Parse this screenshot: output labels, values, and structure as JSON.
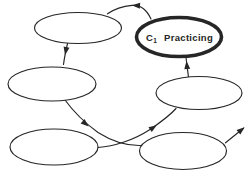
{
  "figure": {
    "width": 252,
    "height": 174,
    "background_color": "#ffffff",
    "ink_color": "#262626"
  },
  "diagram": {
    "type": "cycle-flow",
    "highlighted_node_label": {
      "base": "C",
      "subscript": "1",
      "text": "Practicing"
    },
    "nodes": [
      {
        "id": "stage-top-left",
        "label": "",
        "cx": 78,
        "cy": 28,
        "rx": 43.5,
        "ry": 15.5,
        "emphasis": false
      },
      {
        "id": "stage-c1-practicing",
        "label": "C1 Practicing",
        "cx": 179,
        "cy": 37,
        "rx": 42.5,
        "ry": 19.5,
        "emphasis": true
      },
      {
        "id": "stage-mid-left",
        "label": "",
        "cx": 52,
        "cy": 84,
        "rx": 44,
        "ry": 17,
        "emphasis": false
      },
      {
        "id": "stage-mid-right",
        "label": "",
        "cx": 199,
        "cy": 93,
        "rx": 43,
        "ry": 16.5,
        "emphasis": false
      },
      {
        "id": "stage-bottom-left",
        "label": "",
        "cx": 54,
        "cy": 147,
        "rx": 44,
        "ry": 18,
        "emphasis": false
      },
      {
        "id": "stage-bottom-right",
        "label": "",
        "cx": 183,
        "cy": 151,
        "rx": 43.5,
        "ry": 18.5,
        "emphasis": false
      }
    ],
    "edges": [
      {
        "id": "edge-c1-to-top-left",
        "from": "stage-c1-practicing",
        "to": "stage-top-left",
        "path": "M 151,19 C 146,8 140,4.8 132,5.4 C 121,6.4 113,10 107.5,13.8",
        "head": {
          "x": 133.5,
          "y": 5.3,
          "angle": 184
        }
      },
      {
        "id": "edge-top-left-to-mid-left",
        "from": "stage-top-left",
        "to": "stage-mid-left",
        "path": "M 67.5,43.5 C 66,50 64.5,57 63.5,64.5",
        "head": {
          "x": 65.3,
          "y": 53.5,
          "angle": 101
        }
      },
      {
        "id": "edge-mid-left-to-bottom-right",
        "from": "stage-mid-left",
        "to": "stage-bottom-right",
        "path": "M 65,100 C 73,111 85,123 98,132.5 C 111.5,141 127,145.8 140.5,145.5",
        "head": {
          "x": 87.5,
          "y": 125.5,
          "angle": 41
        }
      },
      {
        "id": "edge-bottom-left-to-mid-right",
        "from": "stage-bottom-left",
        "to": "stage-mid-right",
        "path": "M 98,147.5 C 114,146.5 134,140 150,129.5 C 159.5,123 169,116.5 176,108.5",
        "head": {
          "x": 155.5,
          "y": 126,
          "angle": -34
        }
      },
      {
        "id": "edge-mid-right-to-c1",
        "from": "stage-mid-right",
        "to": "stage-c1-practicing",
        "path": "M 188.5,77.5 C 187.7,70.5 186.8,64 186,57.5",
        "head": {
          "x": 186.6,
          "y": 62.5,
          "angle": -96
        }
      },
      {
        "id": "edge-bottom-right-exit",
        "from": "stage-bottom-right",
        "to": "outside",
        "path": "M 225.5,142.8 L 243.5,128.2",
        "head": {
          "x": 243.5,
          "y": 128.2,
          "angle": -39
        }
      }
    ],
    "stroke": {
      "thin_width": 1.15,
      "emphasis_width": 3.6
    }
  }
}
